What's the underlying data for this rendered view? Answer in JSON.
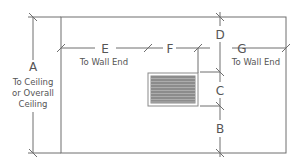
{
  "diagram": {
    "type": "wall-vent-placement-dimensions",
    "colors": {
      "line": "#6e6e6e",
      "text": "#555555",
      "vent_fill": "#8c8c8c",
      "vent_stripe": "#b5b5b5",
      "background": "#ffffff"
    },
    "dimensions": {
      "A": {
        "letter": "A",
        "line1": "To Ceiling",
        "line2": "or Overall",
        "line3": "Ceiling"
      },
      "B": {
        "letter": "B"
      },
      "C": {
        "letter": "C"
      },
      "D": {
        "letter": "D"
      },
      "E": {
        "letter": "E",
        "note": "To Wall End"
      },
      "F": {
        "letter": "F"
      },
      "G": {
        "letter": "G",
        "note": "To Wall End"
      }
    },
    "vent": {
      "name": "grille",
      "stripes": 9
    }
  }
}
